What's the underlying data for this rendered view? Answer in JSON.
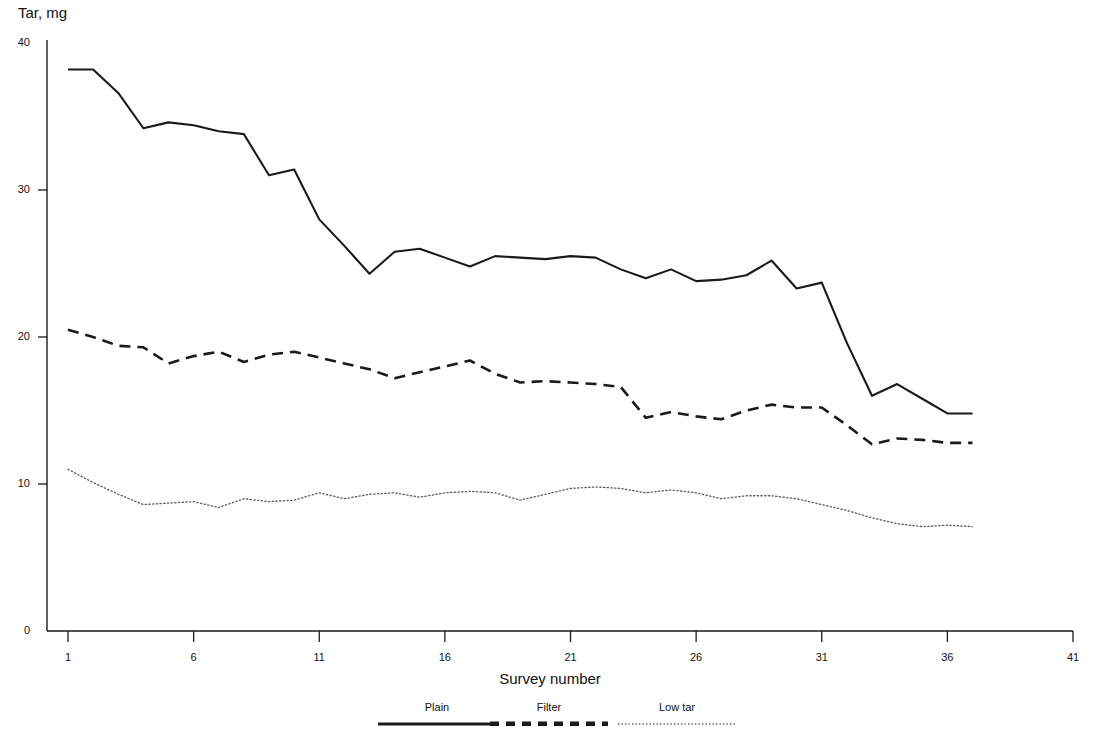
{
  "chart_data": {
    "type": "line",
    "title": "",
    "ylabel": "Tar, mg",
    "xlabel": "Survey number",
    "xlim": [
      1,
      41
    ],
    "ylim": [
      0,
      40
    ],
    "grid": false,
    "legend_position": "bottom",
    "xticks": [
      "1",
      "6",
      "11",
      "16",
      "21",
      "26",
      "31",
      "36",
      "41"
    ],
    "xtick_values": [
      1,
      6,
      11,
      16,
      21,
      26,
      31,
      36,
      41
    ],
    "yticks": [
      "0",
      "10",
      "20",
      "30",
      "40"
    ],
    "ytick_values": [
      0,
      10,
      20,
      30,
      40
    ],
    "x": [
      1,
      2,
      3,
      4,
      5,
      6,
      7,
      8,
      9,
      10,
      11,
      12,
      13,
      14,
      15,
      16,
      17,
      18,
      19,
      20,
      21,
      22,
      23,
      24,
      25,
      26,
      27,
      28,
      29,
      30,
      31,
      32,
      33,
      34,
      35,
      36,
      37
    ],
    "series": [
      {
        "name": "Plain",
        "style": "solid",
        "color": "#1a1a1a",
        "values": [
          38.2,
          38.2,
          36.6,
          34.2,
          34.6,
          34.4,
          34.0,
          33.8,
          31.0,
          31.4,
          28.0,
          26.2,
          24.3,
          25.8,
          26.0,
          25.4,
          24.8,
          25.5,
          25.4,
          25.3,
          25.5,
          25.4,
          24.6,
          24.0,
          24.6,
          23.8,
          23.9,
          24.2,
          25.2,
          23.3,
          23.7,
          19.6,
          16.0,
          16.8,
          15.8,
          14.8,
          14.8
        ]
      },
      {
        "name": "Filter",
        "style": "dashed",
        "color": "#1a1a1a",
        "values": [
          20.5,
          20.0,
          19.4,
          19.3,
          18.2,
          18.7,
          19.0,
          18.3,
          18.8,
          19.0,
          18.6,
          18.2,
          17.8,
          17.2,
          17.6,
          18.0,
          18.4,
          17.5,
          16.9,
          17.0,
          16.9,
          16.8,
          16.6,
          14.5,
          14.9,
          14.6,
          14.4,
          15.0,
          15.4,
          15.2,
          15.2,
          14.0,
          12.7,
          13.1,
          13.0,
          12.8,
          12.8
        ]
      },
      {
        "name": "Low tar",
        "style": "dotted",
        "color": "#1a1a1a",
        "values": [
          11.0,
          10.1,
          9.3,
          8.6,
          8.7,
          8.8,
          8.4,
          9.0,
          8.8,
          8.9,
          9.4,
          9.0,
          9.3,
          9.4,
          9.1,
          9.4,
          9.5,
          9.4,
          8.9,
          9.3,
          9.7,
          9.8,
          9.7,
          9.4,
          9.6,
          9.4,
          9.0,
          9.2,
          9.2,
          9.0,
          8.6,
          8.2,
          7.7,
          7.3,
          7.1,
          7.2,
          7.1
        ]
      }
    ]
  },
  "legend": {
    "entries": [
      {
        "label": "Plain"
      },
      {
        "label": "Filter"
      },
      {
        "label": "Low tar"
      }
    ]
  }
}
